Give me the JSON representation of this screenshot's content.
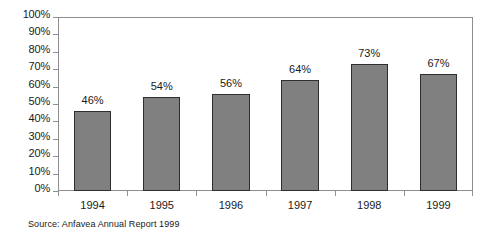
{
  "chart_data": {
    "type": "bar",
    "title": "",
    "subtitle": "",
    "xlabel": "",
    "ylabel": "",
    "categories": [
      "1994",
      "1995",
      "1996",
      "1997",
      "1998",
      "1999"
    ],
    "values": [
      46,
      54,
      56,
      64,
      73,
      67
    ],
    "value_labels": [
      "46%",
      "54%",
      "56%",
      "64%",
      "73%",
      "67%"
    ],
    "ylim": [
      0,
      100
    ],
    "ytick_values": [
      0,
      10,
      20,
      30,
      40,
      50,
      60,
      70,
      80,
      90,
      100
    ],
    "ytick_labels": [
      "0%",
      "10%",
      "20%",
      "30%",
      "40%",
      "50%",
      "60%",
      "70%",
      "80%",
      "90%",
      "100%"
    ],
    "grid": false,
    "legend": false,
    "legend_position": "none",
    "bar_color": "#808080",
    "bar_border_color": "#2e2e2e",
    "axis_color": "#8e8e8e",
    "background_color": "#ffffff",
    "text_color": "#1a1a1a"
  },
  "annotations": {
    "source": "Source: Anfavea Annual Report 1999"
  }
}
